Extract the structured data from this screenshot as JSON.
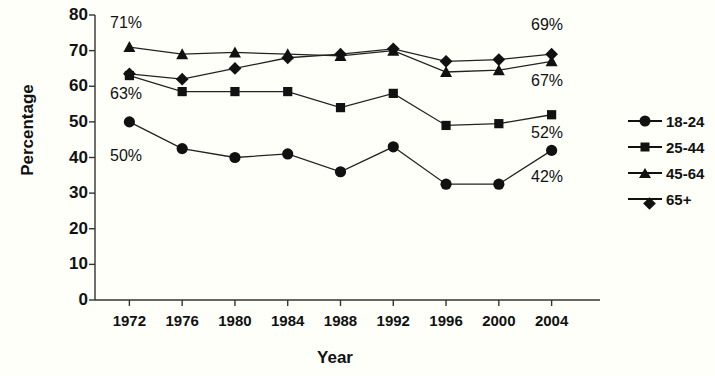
{
  "chart_data": {
    "type": "line",
    "title": "",
    "xlabel": "Year",
    "ylabel": "Percentage",
    "x": [
      1972,
      1976,
      1980,
      1984,
      1988,
      1992,
      1996,
      2000,
      2004
    ],
    "categories": [
      "1972",
      "1976",
      "1980",
      "1984",
      "1988",
      "1992",
      "1996",
      "2000",
      "2004"
    ],
    "xlim": [
      1970,
      2006
    ],
    "ylim": [
      0,
      80
    ],
    "yticks": [
      0,
      10,
      20,
      30,
      40,
      50,
      60,
      70,
      80
    ],
    "ytick_labels": [
      "0",
      "10",
      "20",
      "30",
      "40",
      "50",
      "60",
      "70",
      "80"
    ],
    "grid": false,
    "legend_position": "right",
    "series": [
      {
        "name": "18-24",
        "marker": "circle",
        "color": "#111111",
        "values": [
          50,
          42.5,
          40,
          41,
          36,
          43,
          32.5,
          32.5,
          42
        ]
      },
      {
        "name": "25-44",
        "marker": "square",
        "color": "#111111",
        "values": [
          63,
          58.5,
          58.5,
          58.5,
          54,
          58,
          49,
          49.5,
          52
        ]
      },
      {
        "name": "45-64",
        "marker": "triangle",
        "color": "#111111",
        "values": [
          71,
          69,
          69.5,
          69,
          68.5,
          70,
          64,
          64.5,
          67
        ]
      },
      {
        "name": "65+",
        "marker": "diamond",
        "color": "#111111",
        "values": [
          63.5,
          62,
          65,
          68,
          69,
          70.5,
          67,
          67.5,
          69
        ]
      }
    ],
    "annotations": [
      {
        "text": "71%",
        "x_px": 110,
        "y_px": 14
      },
      {
        "text": "63%",
        "x_px": 110,
        "y_px": 85
      },
      {
        "text": "50%",
        "x_px": 110,
        "y_px": 147
      },
      {
        "text": "69%",
        "x_px": 531,
        "y_px": 16
      },
      {
        "text": "67%",
        "x_px": 531,
        "y_px": 72
      },
      {
        "text": "52%",
        "x_px": 531,
        "y_px": 124
      },
      {
        "text": "42%",
        "x_px": 531,
        "y_px": 168
      }
    ]
  },
  "legend": {
    "items": [
      {
        "label": "18-24",
        "marker": "circle"
      },
      {
        "label": "25-44",
        "marker": "square"
      },
      {
        "label": "45-64",
        "marker": "triangle"
      },
      {
        "label": "65+",
        "marker": "diamond"
      }
    ]
  }
}
